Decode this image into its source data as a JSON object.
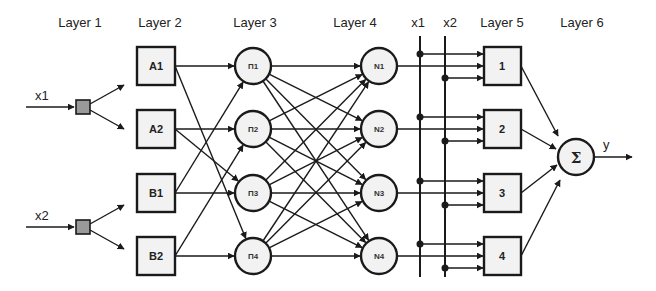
{
  "headers": [
    "Layer 1",
    "Layer 2",
    "Layer 3",
    "Layer 4",
    "x1",
    "x2",
    "Layer 5",
    "Layer 6"
  ],
  "inputs": [
    "x1",
    "x2"
  ],
  "layer2": [
    "A1",
    "A2",
    "B1",
    "B2"
  ],
  "layer3": [
    "П1",
    "П2",
    "П3",
    "П4"
  ],
  "layer4": [
    "N1",
    "N2",
    "N3",
    "N4"
  ],
  "layer5": [
    "1",
    "2",
    "3",
    "4"
  ],
  "layer6": {
    "symbol": "Σ",
    "output": "y"
  },
  "connections": {
    "layer1_to_layer2": [
      [
        0,
        0
      ],
      [
        0,
        1
      ],
      [
        1,
        2
      ],
      [
        1,
        3
      ]
    ],
    "layer2_to_layer3": [
      [
        0,
        0
      ],
      [
        0,
        3
      ],
      [
        1,
        1
      ],
      [
        1,
        2
      ],
      [
        2,
        0
      ],
      [
        2,
        2
      ],
      [
        3,
        1
      ],
      [
        3,
        3
      ]
    ],
    "layer3_to_layer4": "fully-connected",
    "layer4_to_layer5": [
      [
        0,
        0
      ],
      [
        1,
        1
      ],
      [
        2,
        2
      ],
      [
        3,
        3
      ]
    ],
    "bus_to_layer5": {
      "x1": [
        0,
        1,
        2,
        3
      ],
      "x2": [
        0,
        1,
        2,
        3
      ]
    },
    "layer5_to_layer6": "all"
  }
}
